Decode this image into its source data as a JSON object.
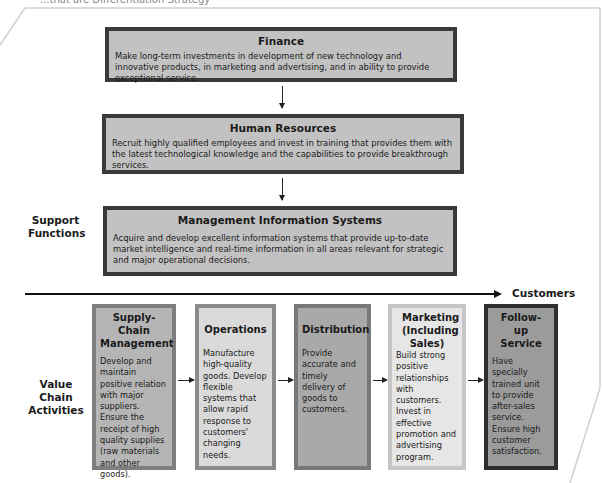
{
  "caption": "...that are Differentiation Strategy",
  "support_functions": {
    "label": "Support Functions",
    "boxes": [
      {
        "title": "Finance",
        "text": "Make long-term investments in development of new technology and  innovative products, in marketing and advertising, and in ability to provide exceptional service."
      },
      {
        "title": "Human Resources",
        "text": "Recruit highly qualified employees and invest in training that provides them with the latest technological knowledge and the capabilities to provide breakthrough services."
      },
      {
        "title": "Management Information Systems",
        "text": "Acquire and develop excellent information systems that provide up-to-date market intelligence and real-time information in all areas relevant for strategic and major operational decisions."
      }
    ]
  },
  "flow_arrow": {
    "target_label": "Customers"
  },
  "value_chain": {
    "label": "Value Chain Activities",
    "boxes": [
      {
        "title": "Supply-Chain Management",
        "text": "Develop and maintain positive relation with major suppliers. Ensure the receipt of high quality supplies (raw materials and other goods).",
        "fill": "#b5b5b5",
        "border": "#7e7e7e"
      },
      {
        "title": "Operations",
        "text": "Manufacture high-quality goods. Develop flexible systems that allow rapid response to customers' changing needs.",
        "fill": "#dadada",
        "border": "#8a8a8a"
      },
      {
        "title": "Distribution",
        "text": "Provide accurate and timely delivery of goods to customers.",
        "fill": "#a9a9a9",
        "border": "#787878"
      },
      {
        "title": "Marketing (Including Sales)",
        "text": "Build strong positive relationships with customers. Invest in effective promotion and advertising program.",
        "fill": "#e6e6e6",
        "border": "#c6c6c6"
      },
      {
        "title": "Follow-up Service",
        "text": "Have specially trained unit to provide after-sales service. Ensure high customer satisfaction.",
        "fill": "#9b9b9b",
        "border": "#2e2e2e"
      }
    ]
  }
}
